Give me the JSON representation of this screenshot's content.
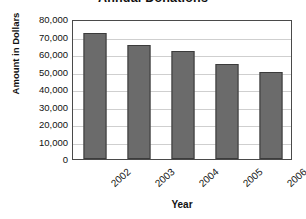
{
  "chart_data": {
    "type": "bar",
    "title": "Annual Donations",
    "xlabel": "Year",
    "ylabel": "Amount in Dollars",
    "categories": [
      "2002",
      "2003",
      "2004",
      "2005",
      "2006"
    ],
    "values": [
      72000,
      65000,
      62000,
      54500,
      49500
    ],
    "ylim": [
      0,
      80000
    ],
    "ytick_step": 10000,
    "ytick_labels": [
      "80,000",
      "70,000",
      "60,000",
      "50,000",
      "40,000",
      "30,000",
      "20,000",
      "10,000",
      "0"
    ],
    "ytick_values": [
      80000,
      70000,
      60000,
      50000,
      40000,
      30000,
      20000,
      10000,
      0
    ],
    "grid": "horizontal",
    "legend": "none",
    "series": [
      {
        "name": "Annual Donations",
        "values": [
          72000,
          65000,
          62000,
          54500,
          49500
        ]
      }
    ],
    "colors": {
      "bar_fill": "#6b6b6b",
      "bar_outline": "#3b3b3b",
      "gridline": "#cfcfcf",
      "plot_border": "#4a4a4a",
      "background": "#ffffff",
      "text": "#111111"
    }
  }
}
